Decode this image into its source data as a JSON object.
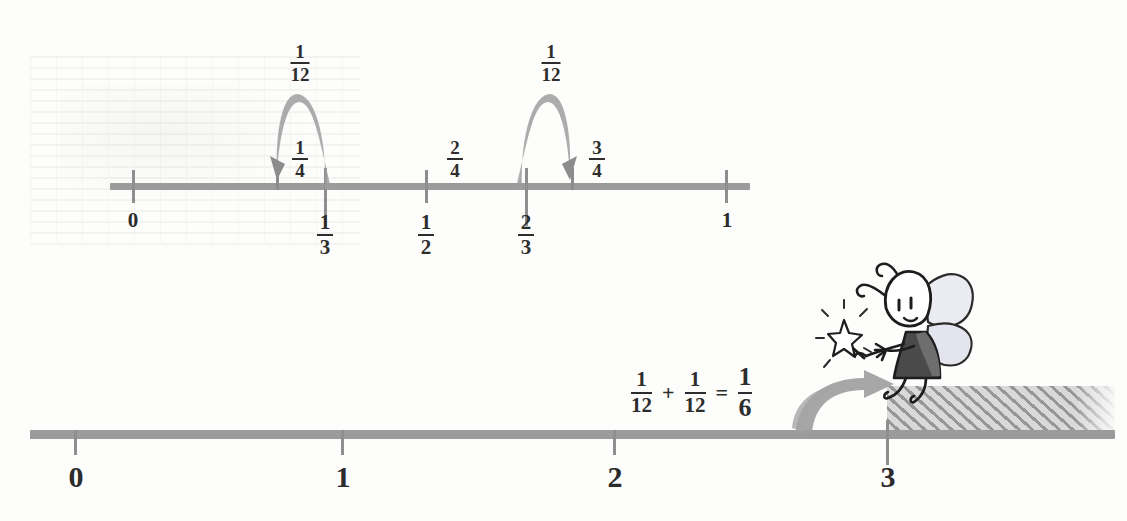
{
  "figure": {
    "type": "math-worksheet-number-lines"
  },
  "top_line": {
    "name": "unit-interval-number-line",
    "range_start": "0",
    "range_end": "1",
    "below_labels": [
      {
        "text_num": "",
        "text": "0",
        "kind": "integer",
        "value": 0
      },
      {
        "text_num": "1",
        "text_den": "3",
        "kind": "fraction",
        "value": 0.3333
      },
      {
        "text_num": "1",
        "text_den": "2",
        "kind": "fraction",
        "value": 0.5
      },
      {
        "text_num": "2",
        "text_den": "3",
        "kind": "fraction",
        "value": 0.6667
      },
      {
        "text_num": "",
        "text": "1",
        "kind": "integer",
        "value": 1
      }
    ],
    "above_labels": [
      {
        "text_num": "1",
        "text_den": "4",
        "value": 0.25
      },
      {
        "text_num": "2",
        "text_den": "4",
        "value": 0.5
      },
      {
        "text_num": "3",
        "text_den": "4",
        "value": 0.75
      }
    ],
    "arcs": [
      {
        "name": "hop-from-one-third-to-one-fourth",
        "label_num": "1",
        "label_den": "12",
        "from_value": 0.3333,
        "to_value": 0.25,
        "direction": "left"
      },
      {
        "name": "hop-from-two-thirds-to-three-fourths",
        "label_num": "1",
        "label_den": "12",
        "from_value": 0.6667,
        "to_value": 0.75,
        "direction": "right"
      }
    ]
  },
  "bottom_line": {
    "name": "whole-number-line",
    "ticks": [
      "0",
      "1",
      "2",
      "3"
    ],
    "equation": {
      "term1_num": "1",
      "term1_den": "12",
      "plus": "+",
      "term2_num": "1",
      "term2_den": "12",
      "equals": "=",
      "result_num": "1",
      "result_den": "6"
    },
    "shaded_region_start": "3",
    "shaded_region_note": "hatched region to the right of 3"
  },
  "character": {
    "name": "fairy",
    "holds": "magic-wand-with-star"
  },
  "colors": {
    "line_gray": "#9b9b9b",
    "arc_gray": "#9d9d9d",
    "ink": "#2d2d2d",
    "hatch_gray": "#8f8f8f",
    "fairy_dress": "#4a4a4a",
    "fairy_wing": "#e8e8ee",
    "paper": "#fdfdfc"
  }
}
